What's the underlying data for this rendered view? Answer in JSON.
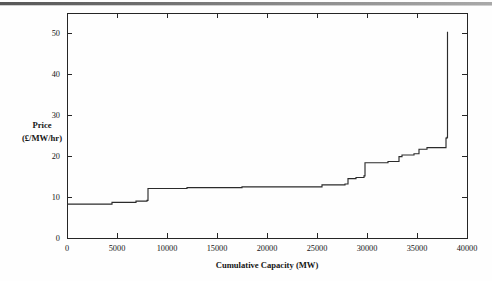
{
  "figure": {
    "name": "supply-curve-figure",
    "background_color": "#fefefe",
    "line_color": "#2b2b2b",
    "axis_color": "#262626"
  },
  "chart_data": {
    "type": "line",
    "subtype": "step",
    "title": "",
    "xlabel": "Cumulative Capacity (MW)",
    "ylabel_line1": "Price",
    "ylabel_line2": "(£/MW/hr)",
    "ylabel": "Price (£/MW/hr)",
    "xlim": [
      0,
      40000
    ],
    "ylim": [
      0,
      55
    ],
    "xticks": [
      0,
      5000,
      10000,
      15000,
      20000,
      25000,
      30000,
      35000,
      40000
    ],
    "xticklabels": [
      "0",
      "5000",
      "10000",
      "15000",
      "20000",
      "25000",
      "30000",
      "35000",
      "40000"
    ],
    "yticks": [
      0,
      10,
      20,
      30,
      40,
      50
    ],
    "yticklabels": [
      "0",
      "10",
      "20",
      "30",
      "40",
      "50"
    ],
    "grid": false,
    "legend": false,
    "legend_position": "none",
    "series": [
      {
        "name": "Supply curve",
        "step_mode": "post",
        "x": [
          0,
          4500,
          6900,
          8000,
          8100,
          12000,
          17500,
          25500,
          27800,
          28100,
          28900,
          29700,
          29800,
          32100,
          33200,
          33500,
          34700,
          35200,
          36000,
          37900,
          38000,
          38050
        ],
        "y": [
          8.3,
          8.7,
          9.0,
          9.2,
          12.1,
          12.3,
          12.5,
          13.0,
          13.2,
          14.5,
          14.8,
          15.2,
          18.4,
          18.7,
          19.9,
          20.3,
          20.6,
          21.7,
          22.1,
          24.4,
          24.6,
          50.4
        ]
      }
    ]
  }
}
